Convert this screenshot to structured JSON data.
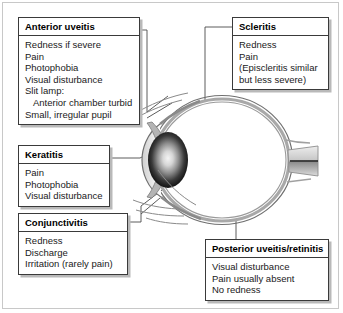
{
  "figure": {
    "type": "medical-diagram",
    "frame_border_color": "#c8c8c8",
    "background_color": "#ffffff"
  },
  "eye": {
    "label": "eye-cross-section",
    "parts": [
      "sclera",
      "choroid",
      "retina",
      "cornea",
      "anterior-chamber",
      "iris",
      "lens",
      "optic-nerve",
      "conjunctiva"
    ],
    "lens_gradient": {
      "center": "#f2f2f2",
      "edge": "#000000"
    },
    "outline_color": "#8a8a8a",
    "line_color": "#555555"
  },
  "callouts": [
    {
      "id": "anterior-uveitis",
      "title": "Anterior uveitis",
      "lines": [
        {
          "text": "Redness if severe",
          "indent": false
        },
        {
          "text": "Pain",
          "indent": false
        },
        {
          "text": "Photophobia",
          "indent": false
        },
        {
          "text": "Visual disturbance",
          "indent": false
        },
        {
          "text": "Slit lamp:",
          "indent": false
        },
        {
          "text": "Anterior chamber turbid",
          "indent": true
        },
        {
          "text": "Small, irregular pupil",
          "indent": false
        }
      ]
    },
    {
      "id": "scleritis",
      "title": "Scleritis",
      "lines": [
        {
          "text": "Redness",
          "indent": false
        },
        {
          "text": "Pain",
          "indent": false
        },
        {
          "text": "(Episcleritis similar",
          "indent": false
        },
        {
          "text": "but less severe)",
          "indent": false
        }
      ]
    },
    {
      "id": "keratitis",
      "title": "Keratitis",
      "lines": [
        {
          "text": "Pain",
          "indent": false
        },
        {
          "text": "Photophobia",
          "indent": false
        },
        {
          "text": "Visual disturbance",
          "indent": false
        }
      ]
    },
    {
      "id": "conjunctivitis",
      "title": "Conjunctivitis",
      "lines": [
        {
          "text": "Redness",
          "indent": false
        },
        {
          "text": "Discharge",
          "indent": false
        },
        {
          "text": "Irritation (rarely pain)",
          "indent": false
        }
      ]
    },
    {
      "id": "posterior-uveitis-retinitis",
      "title": "Posterior uveitis/retinitis",
      "lines": [
        {
          "text": "Visual disturbance",
          "indent": false
        },
        {
          "text": "Pain usually absent",
          "indent": false
        },
        {
          "text": "No redness",
          "indent": false
        }
      ]
    }
  ]
}
